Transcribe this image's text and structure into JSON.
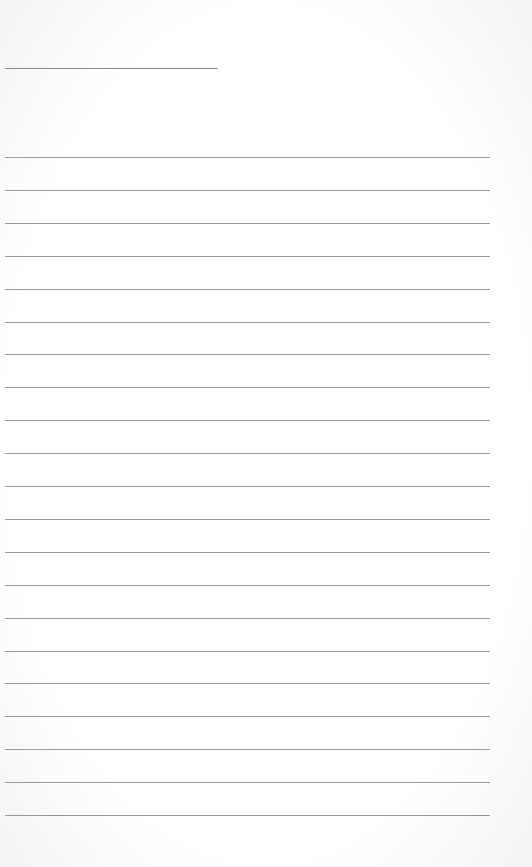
{
  "document": {
    "type": "lined-paper",
    "name_line": {
      "label": ""
    },
    "rules": {
      "count": 21,
      "first_y": 157,
      "spacing": 32.9,
      "color": "#9a9a9a"
    }
  }
}
